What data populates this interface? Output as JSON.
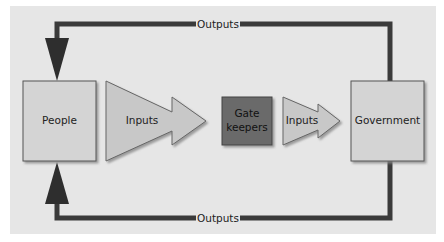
{
  "diagram": {
    "nodes": {
      "people": {
        "label": "People"
      },
      "inputs_large": {
        "label": "Inputs"
      },
      "gatekeepers": {
        "label_line1": "Gate",
        "label_line2": "keepers"
      },
      "inputs_small": {
        "label": "Inputs"
      },
      "government": {
        "label": "Government"
      }
    },
    "edges": {
      "top_output": {
        "label": "Outputs",
        "from": "Government",
        "to": "People"
      },
      "bottom_output": {
        "label": "Outputs",
        "from": "Government",
        "to": "People"
      }
    },
    "colors": {
      "background": "#e6e6e6",
      "box_fill": "#d4d4d4",
      "arrow_fill": "#c8c8c8",
      "gatekeeper_fill": "#6b6b6b",
      "line": "#3a3a3a"
    }
  }
}
